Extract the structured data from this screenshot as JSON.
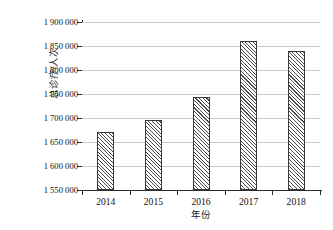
{
  "chart_data": {
    "type": "bar",
    "title": "",
    "subtitle": "",
    "xlabel": "年份",
    "ylabel": "总诊疗/人次",
    "categories": [
      "2014",
      "2015",
      "2016",
      "2017",
      "2018"
    ],
    "values": [
      1670000,
      1695000,
      1744000,
      1860000,
      1840000
    ],
    "series": [
      {
        "name": "总诊疗/人次",
        "values": [
          1670000,
          1695000,
          1744000,
          1860000,
          1840000
        ]
      }
    ],
    "ylim": [
      1550000,
      1900000
    ],
    "ytick_values": [
      1550000,
      1600000,
      1650000,
      1700000,
      1750000,
      1800000,
      1850000,
      1900000
    ],
    "ytick_labels": [
      "1 550 000",
      "1 600 000",
      "1 650 000",
      "1 700 000",
      "1 750 000",
      "1 800 000",
      "1 850 000",
      "1 900 000"
    ],
    "xtick_labels": [
      "2014",
      "2015",
      "2016",
      "2017",
      "2018"
    ],
    "grid": true,
    "grid_axis": "y",
    "legend": false,
    "legend_position": "none",
    "bar_fill": "hatch-diagonal",
    "bar_edge_color": "#3a3a3a",
    "grid_color": "#c9c9c9",
    "axis_color": "#2b2b2b",
    "background": "#ffffff"
  }
}
